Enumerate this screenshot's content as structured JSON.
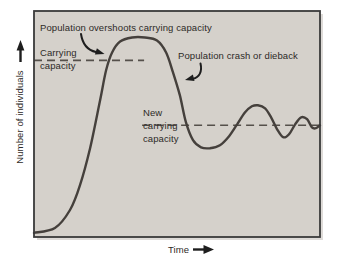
{
  "colors": {
    "canvas_bg": "#ffffff",
    "plot_bg": "#d5d1cb",
    "curve": "#45403c",
    "dashed_line": "#55504b",
    "border": "#3a3a3a",
    "text": "#2d2a27",
    "arrow": "#1e1e1e"
  },
  "labels": {
    "y_axis": "Number of individuals",
    "x_axis": "Time",
    "overshoot": "Population overshoots carrying capacity",
    "carrying_capacity": "Carrying\ncapacity",
    "crash": "Population crash or dieback",
    "new_carrying_capacity": "New\ncarrying\ncapacity"
  },
  "chart_data": {
    "type": "line",
    "title": "",
    "xlabel": "Time",
    "ylabel": "Number of individuals",
    "xlim": [
      0,
      100
    ],
    "ylim": [
      0,
      128
    ],
    "grid": false,
    "axis_ticks": "none (conceptual diagram, unlabeled axes)",
    "series": [
      {
        "name": "population",
        "x": [
          0,
          7.3,
          12.6,
          16.1,
          19.6,
          23.1,
          25.2,
          27.3,
          30.1,
          34.3,
          38.8,
          43,
          46.2,
          48.6,
          51,
          53.1,
          55.6,
          58.4,
          61.5,
          65,
          68.2,
          71,
          73.8,
          76.2,
          78.3,
          80.8,
          82.9,
          85,
          87.1,
          89.2,
          91.3,
          93.4,
          95.5,
          97.2,
          98.6,
          100
        ],
        "y": [
          2.3,
          5.1,
          15.3,
          29.4,
          50.3,
          77.4,
          94.4,
          104.5,
          110.7,
          113,
          113,
          111.3,
          104.5,
          93.2,
          80.2,
          65,
          54.8,
          50.8,
          50.3,
          52,
          57.1,
          63.8,
          70.6,
          74,
          74.6,
          72.9,
          67.8,
          61,
          56.5,
          58.2,
          63.8,
          67.8,
          66.7,
          62.1,
          61.6,
          63.3
        ]
      }
    ],
    "reference_lines": [
      {
        "name": "carrying-capacity",
        "label": "Carrying capacity",
        "y": 100,
        "x_start": 0,
        "x_end": 38.5,
        "style": "dashed"
      },
      {
        "name": "new-carrying-capacity",
        "label": "New carrying capacity",
        "y": 63.3,
        "x_start": 37.8,
        "x_end": 100,
        "style": "dashed"
      }
    ],
    "annotations": [
      {
        "text": "Population overshoots carrying capacity",
        "points_to": "curve crossing carrying capacity on the rise"
      },
      {
        "text": "Population crash or dieback",
        "points_to": "steep descending limb of curve"
      }
    ]
  }
}
